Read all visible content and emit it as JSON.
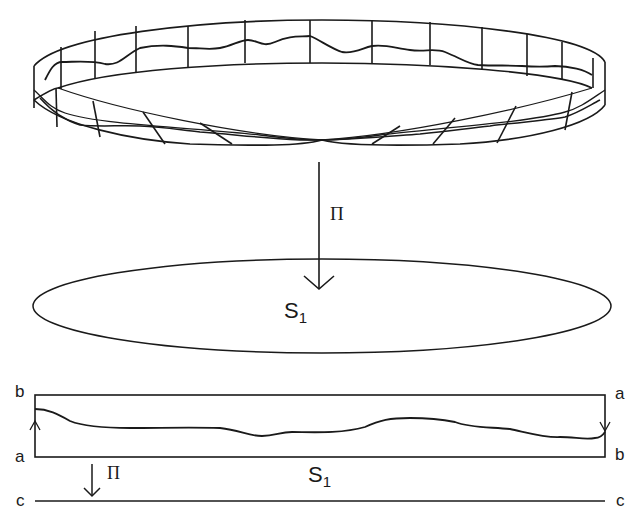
{
  "figure": {
    "colors": {
      "stroke": "#1a1a1a",
      "background": "#ffffff"
    },
    "mobius_band": {
      "label": ""
    },
    "projection_main": {
      "label": "Π"
    },
    "circle": {
      "label_base": "S",
      "label_sub": "1"
    },
    "rectangle": {
      "corner_top_left": "b",
      "corner_bottom_left": "a",
      "corner_top_right": "a",
      "corner_bottom_right": "b",
      "center_label_base": "S",
      "center_label_sub": "1"
    },
    "projection_small": {
      "label": "Π"
    },
    "base_line": {
      "left_label": "c",
      "right_label": "c"
    }
  }
}
